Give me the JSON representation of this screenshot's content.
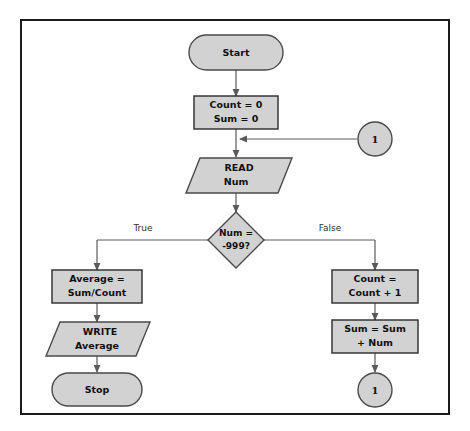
{
  "diagram": {
    "frame": {
      "border_color": "#1b1b1b"
    },
    "style": {
      "node_fill": "#d2d2d2",
      "node_stroke": "#4a4a4a",
      "line_color": "#5a5a5a",
      "text_color": "#111111",
      "background": "#ffffff"
    },
    "nodes": {
      "start": {
        "type": "terminator",
        "label": "Start"
      },
      "init": {
        "type": "process",
        "line1": "Count = 0",
        "line2": "Sum = 0"
      },
      "read": {
        "type": "input-output",
        "line1": "READ",
        "line2": "Num"
      },
      "decision": {
        "type": "decision",
        "line1": "Num =",
        "line2": "-999?"
      },
      "average": {
        "type": "process",
        "line1": "Average =",
        "line2": "Sum/Count"
      },
      "write": {
        "type": "input-output",
        "line1": "WRITE",
        "line2": "Average"
      },
      "stop": {
        "type": "terminator",
        "label": "Stop"
      },
      "count_inc": {
        "type": "process",
        "line1": "Count =",
        "line2": "Count + 1"
      },
      "sum_add": {
        "type": "process",
        "line1": "Sum = Sum",
        "line2": "+ Num"
      },
      "connector_top": {
        "type": "connector",
        "label": "1"
      },
      "connector_bottom": {
        "type": "connector",
        "label": "1"
      }
    },
    "branch_labels": {
      "true": "True",
      "false": "False"
    }
  }
}
